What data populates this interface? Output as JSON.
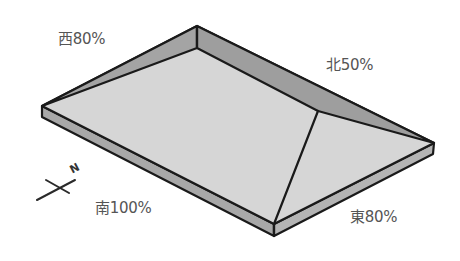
{
  "diagram": {
    "type": "isometric-hip-roof",
    "colors": {
      "outline": "#1a1a1a",
      "top_surface": "#d4d4d4",
      "side_face": "#a8a8a8",
      "inner_wall": "#9e9e9e",
      "label_text": "#555555"
    },
    "labels": {
      "west": "西80%",
      "north": "北50%",
      "south": "南100%",
      "east": "東80%"
    },
    "compass": {
      "north_letter": "N"
    }
  }
}
